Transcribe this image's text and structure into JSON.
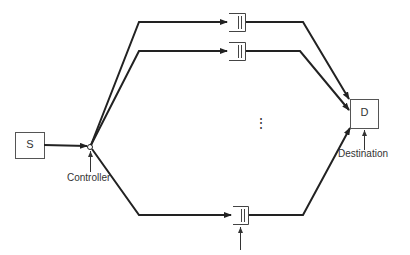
{
  "diagram": {
    "nodes": {
      "source": {
        "label": "S"
      },
      "destination": {
        "label": "D"
      }
    },
    "labels": {
      "controller": "Controller",
      "destination": "Destination",
      "concentrators": "Q concentrators",
      "ellipsis": "⋮"
    },
    "paths": [
      {
        "name": "path-1",
        "queue": "concentrator-1"
      },
      {
        "name": "path-2",
        "queue": "concentrator-2"
      },
      {
        "name": "path-Q",
        "queue": "concentrator-Q"
      }
    ],
    "colors": {
      "line": "#222222",
      "box": "#555555",
      "text": "#333333"
    }
  }
}
